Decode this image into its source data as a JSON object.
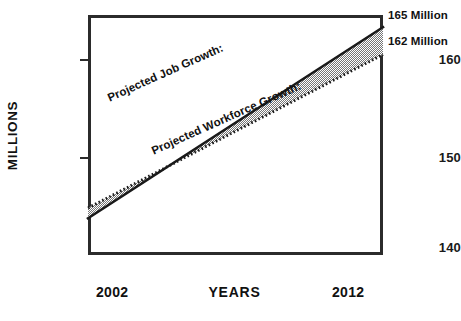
{
  "chart_data": {
    "type": "line",
    "title": "",
    "xlabel": "YEARS",
    "ylabel": "MILLIONS",
    "xlim": [
      2002,
      2012
    ],
    "ylim": [
      140,
      165.5
    ],
    "xticks": [
      "2002",
      "2012"
    ],
    "yticks": [
      "140",
      "150",
      "160"
    ],
    "gridlines": [
      140,
      145,
      150,
      155,
      160,
      165
    ],
    "grid": true,
    "legend_position": "inline-on-series",
    "shaded_area": {
      "between": [
        "Projected Job Growth:",
        "Projected Workforce Growth:"
      ],
      "fill": "gray-dither"
    },
    "series": [
      {
        "name": "Projected Job Growth:",
        "style": "solid",
        "color": "#1a1a1a",
        "x": [
          2002,
          2012
        ],
        "values": [
          143.9,
          164.2
        ],
        "endpoint_label": "165 Million"
      },
      {
        "name": "Projected Workforce Growth:",
        "style": "dotted",
        "color": "#1a1a1a",
        "x": [
          2002,
          2012
        ],
        "values": [
          145.0,
          161.3
        ],
        "endpoint_label": "162 Million"
      }
    ]
  },
  "axes": {
    "y_title": "MILLIONS",
    "x_title": "YEARS",
    "y_tick_labels": [
      "160",
      "150",
      "140"
    ],
    "x_tick_labels": [
      "2002",
      "2012"
    ]
  },
  "annotations": {
    "endpoints": [
      "165 Million",
      "162 Million"
    ],
    "series_labels": [
      "Projected Job Growth:",
      "Projected Workforce Growth:"
    ]
  },
  "colors": {
    "frame": "#2b2b2b",
    "grid": "#c9c9c9",
    "line": "#1a1a1a",
    "fill": "#9a9a9a",
    "background": "#ffffff",
    "text": "#111111"
  }
}
